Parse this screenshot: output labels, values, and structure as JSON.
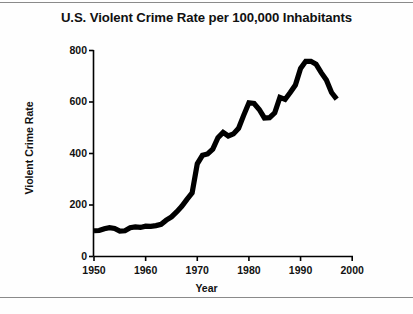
{
  "figure": {
    "title": "U.S. Violent Crime Rate per 100,000 Inhabitants",
    "background_color": "#ffffff",
    "rule_color": "#8a8a8a",
    "line_color": "#000000",
    "axis_color": "#000000"
  },
  "chart_data": {
    "type": "line",
    "title": "U.S. Violent Crime Rate per 100,000 Inhabitants",
    "xlabel": "Year",
    "ylabel": "Violent Crime Rate",
    "xlim": [
      1948,
      2001
    ],
    "ylim": [
      0,
      800
    ],
    "xticks": [
      1950,
      1960,
      1970,
      1980,
      1990,
      2000
    ],
    "xtick_labels": [
      "1950",
      "1960",
      "1970",
      "1980",
      "1990",
      "2000"
    ],
    "yticks": [
      0,
      200,
      400,
      600,
      800
    ],
    "ytick_labels": [
      "0",
      "200",
      "400",
      "600",
      "800"
    ],
    "grid": false,
    "legend": false,
    "series": [
      {
        "name": "Violent Crime Rate",
        "x": [
          1950,
          1951,
          1952,
          1953,
          1954,
          1955,
          1956,
          1957,
          1958,
          1959,
          1960,
          1961,
          1962,
          1963,
          1964,
          1965,
          1966,
          1967,
          1968,
          1969,
          1970,
          1971,
          1972,
          1973,
          1974,
          1975,
          1976,
          1977,
          1978,
          1979,
          1980,
          1981,
          1982,
          1983,
          1984,
          1985,
          1986,
          1987,
          1988,
          1989,
          1990,
          1991,
          1992,
          1993,
          1994,
          1995,
          1996,
          1997
        ],
        "values": [
          100,
          101,
          108,
          112,
          109,
          99,
          100,
          112,
          115,
          113,
          118,
          117,
          120,
          125,
          141,
          154,
          173,
          195,
          222,
          247,
          360,
          393,
          398,
          417,
          461,
          482,
          468,
          476,
          498,
          549,
          597,
          594,
          571,
          538,
          539,
          558,
          618,
          610,
          637,
          666,
          730,
          758,
          758,
          747,
          714,
          685,
          637,
          611
        ]
      }
    ]
  },
  "axis": {
    "ytick_labels": [
      "800",
      "600",
      "400",
      "200",
      "0"
    ],
    "xtick_labels": [
      "1950",
      "1960",
      "1970",
      "1980",
      "1990",
      "2000"
    ],
    "ylabel": "Violent Crime Rate",
    "xlabel": "Year"
  }
}
